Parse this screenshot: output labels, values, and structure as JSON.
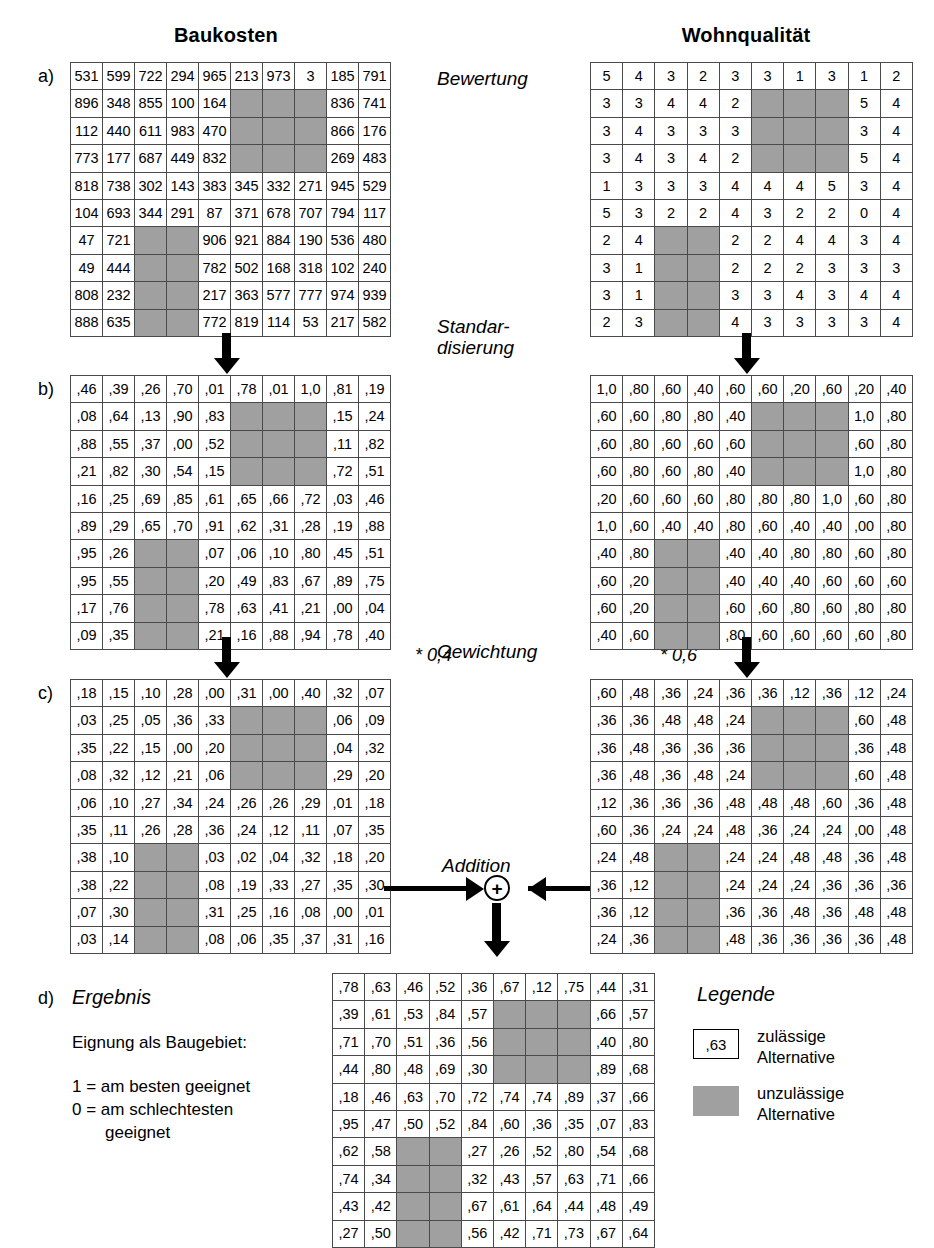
{
  "headers": {
    "left": "Baukosten",
    "right": "Wohnqualität"
  },
  "steps": {
    "bewertung": "Bewertung",
    "standardisierung_l1": "Standar-",
    "standardisierung_l2": "disierung",
    "gewichtung": "Gewichtung",
    "addition": "Addition",
    "weight_left": "* 0,4",
    "weight_right": "* 0,6",
    "plus_symbol": "+"
  },
  "panel_letters": {
    "a": "a)",
    "b": "b)",
    "c": "c)",
    "d": "d)"
  },
  "result": {
    "title": "Ergebnis",
    "caption": "Eignung als Baugebiet:",
    "line1": "1 = am besten geeignet",
    "line2": "0 = am schlechtesten",
    "line3": "geeignet"
  },
  "legend": {
    "title": "Legende",
    "sample_value": ",63",
    "allowed_l1": "zulässige",
    "allowed_l2": "Alternative",
    "disallowed_l1": "unzulässige",
    "disallowed_l2": "Alternative"
  },
  "colors": {
    "gray_cell": "#a0a0a0",
    "grid_border": "#4a4a4a",
    "ink": "#000000"
  },
  "chart_data": {
    "type": "heatmap",
    "grid_size": [
      10,
      10
    ],
    "mask_note": "null = unzulässige Alternative (graue Zelle)",
    "grids": {
      "baukosten_a": {
        "label": "a) Baukosten - Bewertung (Rohwerte)",
        "rows": [
          [
            "531",
            "599",
            "722",
            "294",
            "965",
            "213",
            "973",
            "3",
            "185",
            "791"
          ],
          [
            "896",
            "348",
            "855",
            "100",
            "164",
            null,
            null,
            null,
            "836",
            "741"
          ],
          [
            "112",
            "440",
            "611",
            "983",
            "470",
            null,
            null,
            null,
            "866",
            "176"
          ],
          [
            "773",
            "177",
            "687",
            "449",
            "832",
            null,
            null,
            null,
            "269",
            "483"
          ],
          [
            "818",
            "738",
            "302",
            "143",
            "383",
            "345",
            "332",
            "271",
            "945",
            "529"
          ],
          [
            "104",
            "693",
            "344",
            "291",
            "87",
            "371",
            "678",
            "707",
            "794",
            "117"
          ],
          [
            "47",
            "721",
            null,
            null,
            "906",
            "921",
            "884",
            "190",
            "536",
            "480"
          ],
          [
            "49",
            "444",
            null,
            null,
            "782",
            "502",
            "168",
            "318",
            "102",
            "240"
          ],
          [
            "808",
            "232",
            null,
            null,
            "217",
            "363",
            "577",
            "777",
            "974",
            "939"
          ],
          [
            "888",
            "635",
            null,
            null,
            "772",
            "819",
            "114",
            "53",
            "217",
            "582"
          ]
        ]
      },
      "wohnqualitaet_a": {
        "label": "a) Wohnqualität - Bewertung (Rohwerte 0-5)",
        "rows": [
          [
            "5",
            "4",
            "3",
            "2",
            "3",
            "3",
            "1",
            "3",
            "1",
            "2"
          ],
          [
            "3",
            "3",
            "4",
            "4",
            "2",
            null,
            null,
            null,
            "5",
            "4"
          ],
          [
            "3",
            "4",
            "3",
            "3",
            "3",
            null,
            null,
            null,
            "3",
            "4"
          ],
          [
            "3",
            "4",
            "3",
            "4",
            "2",
            null,
            null,
            null,
            "5",
            "4"
          ],
          [
            "1",
            "3",
            "3",
            "3",
            "4",
            "4",
            "4",
            "5",
            "3",
            "4"
          ],
          [
            "5",
            "3",
            "2",
            "2",
            "4",
            "3",
            "2",
            "2",
            "0",
            "4"
          ],
          [
            "2",
            "4",
            null,
            null,
            "2",
            "2",
            "4",
            "4",
            "3",
            "4"
          ],
          [
            "3",
            "1",
            null,
            null,
            "2",
            "2",
            "2",
            "3",
            "3",
            "3"
          ],
          [
            "3",
            "1",
            null,
            null,
            "3",
            "3",
            "4",
            "3",
            "4",
            "4"
          ],
          [
            "2",
            "3",
            null,
            null,
            "4",
            "3",
            "3",
            "3",
            "3",
            "4"
          ]
        ]
      },
      "baukosten_b": {
        "label": "b) Baukosten - Standardisierung",
        "rows": [
          [
            ",46",
            ",39",
            ",26",
            ",70",
            ",01",
            ",78",
            ",01",
            "1,0",
            ",81",
            ",19"
          ],
          [
            ",08",
            ",64",
            ",13",
            ",90",
            ",83",
            null,
            null,
            null,
            ",15",
            ",24"
          ],
          [
            ",88",
            ",55",
            ",37",
            ",00",
            ",52",
            null,
            null,
            null,
            ",11",
            ",82"
          ],
          [
            ",21",
            ",82",
            ",30",
            ",54",
            ",15",
            null,
            null,
            null,
            ",72",
            ",51"
          ],
          [
            ",16",
            ",25",
            ",69",
            ",85",
            ",61",
            ",65",
            ",66",
            ",72",
            ",03",
            ",46"
          ],
          [
            ",89",
            ",29",
            ",65",
            ",70",
            ",91",
            ",62",
            ",31",
            ",28",
            ",19",
            ",88"
          ],
          [
            ",95",
            ",26",
            null,
            null,
            ",07",
            ",06",
            ",10",
            ",80",
            ",45",
            ",51"
          ],
          [
            ",95",
            ",55",
            null,
            null,
            ",20",
            ",49",
            ",83",
            ",67",
            ",89",
            ",75"
          ],
          [
            ",17",
            ",76",
            null,
            null,
            ",78",
            ",63",
            ",41",
            ",21",
            ",00",
            ",04"
          ],
          [
            ",09",
            ",35",
            null,
            null,
            ",21",
            ",16",
            ",88",
            ",94",
            ",78",
            ",40"
          ]
        ]
      },
      "wohnqualitaet_b": {
        "label": "b) Wohnqualität - Standardisierung",
        "rows": [
          [
            "1,0",
            ",80",
            ",60",
            ",40",
            ",60",
            ",60",
            ",20",
            ",60",
            ",20",
            ",40"
          ],
          [
            ",60",
            ",60",
            ",80",
            ",80",
            ",40",
            null,
            null,
            null,
            "1,0",
            ",80"
          ],
          [
            ",60",
            ",80",
            ",60",
            ",60",
            ",60",
            null,
            null,
            null,
            ",60",
            ",80"
          ],
          [
            ",60",
            ",80",
            ",60",
            ",80",
            ",40",
            null,
            null,
            null,
            "1,0",
            ",80"
          ],
          [
            ",20",
            ",60",
            ",60",
            ",60",
            ",80",
            ",80",
            ",80",
            "1,0",
            ",60",
            ",80"
          ],
          [
            "1,0",
            ",60",
            ",40",
            ",40",
            ",80",
            ",60",
            ",40",
            ",40",
            ",00",
            ",80"
          ],
          [
            ",40",
            ",80",
            null,
            null,
            ",40",
            ",40",
            ",80",
            ",80",
            ",60",
            ",80"
          ],
          [
            ",60",
            ",20",
            null,
            null,
            ",40",
            ",40",
            ",40",
            ",60",
            ",60",
            ",60"
          ],
          [
            ",60",
            ",20",
            null,
            null,
            ",60",
            ",60",
            ",80",
            ",60",
            ",80",
            ",80"
          ],
          [
            ",40",
            ",60",
            null,
            null,
            ",80",
            ",60",
            ",60",
            ",60",
            ",60",
            ",80"
          ]
        ]
      },
      "baukosten_c": {
        "label": "c) Baukosten - Gewichtung (* 0,4)",
        "rows": [
          [
            ",18",
            ",15",
            ",10",
            ",28",
            ",00",
            ",31",
            ",00",
            ",40",
            ",32",
            ",07"
          ],
          [
            ",03",
            ",25",
            ",05",
            ",36",
            ",33",
            null,
            null,
            null,
            ",06",
            ",09"
          ],
          [
            ",35",
            ",22",
            ",15",
            ",00",
            ",20",
            null,
            null,
            null,
            ",04",
            ",32"
          ],
          [
            ",08",
            ",32",
            ",12",
            ",21",
            ",06",
            null,
            null,
            null,
            ",29",
            ",20"
          ],
          [
            ",06",
            ",10",
            ",27",
            ",34",
            ",24",
            ",26",
            ",26",
            ",29",
            ",01",
            ",18"
          ],
          [
            ",35",
            ",11",
            ",26",
            ",28",
            ",36",
            ",24",
            ",12",
            ",11",
            ",07",
            ",35"
          ],
          [
            ",38",
            ",10",
            null,
            null,
            ",03",
            ",02",
            ",04",
            ",32",
            ",18",
            ",20"
          ],
          [
            ",38",
            ",22",
            null,
            null,
            ",08",
            ",19",
            ",33",
            ",27",
            ",35",
            ",30"
          ],
          [
            ",07",
            ",30",
            null,
            null,
            ",31",
            ",25",
            ",16",
            ",08",
            ",00",
            ",01"
          ],
          [
            ",03",
            ",14",
            null,
            null,
            ",08",
            ",06",
            ",35",
            ",37",
            ",31",
            ",16"
          ]
        ]
      },
      "wohnqualitaet_c": {
        "label": "c) Wohnqualität - Gewichtung (* 0,6)",
        "rows": [
          [
            ",60",
            ",48",
            ",36",
            ",24",
            ",36",
            ",36",
            ",12",
            ",36",
            ",12",
            ",24"
          ],
          [
            ",36",
            ",36",
            ",48",
            ",48",
            ",24",
            null,
            null,
            null,
            ",60",
            ",48"
          ],
          [
            ",36",
            ",48",
            ",36",
            ",36",
            ",36",
            null,
            null,
            null,
            ",36",
            ",48"
          ],
          [
            ",36",
            ",48",
            ",36",
            ",48",
            ",24",
            null,
            null,
            null,
            ",60",
            ",48"
          ],
          [
            ",12",
            ",36",
            ",36",
            ",36",
            ",48",
            ",48",
            ",48",
            ",60",
            ",36",
            ",48"
          ],
          [
            ",60",
            ",36",
            ",24",
            ",24",
            ",48",
            ",36",
            ",24",
            ",24",
            ",00",
            ",48"
          ],
          [
            ",24",
            ",48",
            null,
            null,
            ",24",
            ",24",
            ",48",
            ",48",
            ",36",
            ",48"
          ],
          [
            ",36",
            ",12",
            null,
            null,
            ",24",
            ",24",
            ",24",
            ",36",
            ",36",
            ",36"
          ],
          [
            ",36",
            ",12",
            null,
            null,
            ",36",
            ",36",
            ",48",
            ",36",
            ",48",
            ",48"
          ],
          [
            ",24",
            ",36",
            null,
            null,
            ",48",
            ",36",
            ",36",
            ",36",
            ",36",
            ",48"
          ]
        ]
      },
      "ergebnis_d": {
        "label": "d) Ergebnis - Addition",
        "rows": [
          [
            ",78",
            ",63",
            ",46",
            ",52",
            ",36",
            ",67",
            ",12",
            ",75",
            ",44",
            ",31"
          ],
          [
            ",39",
            ",61",
            ",53",
            ",84",
            ",57",
            null,
            null,
            null,
            ",66",
            ",57"
          ],
          [
            ",71",
            ",70",
            ",51",
            ",36",
            ",56",
            null,
            null,
            null,
            ",40",
            ",80"
          ],
          [
            ",44",
            ",80",
            ",48",
            ",69",
            ",30",
            null,
            null,
            null,
            ",89",
            ",68"
          ],
          [
            ",18",
            ",46",
            ",63",
            ",70",
            ",72",
            ",74",
            ",74",
            ",89",
            ",37",
            ",66"
          ],
          [
            ",95",
            ",47",
            ",50",
            ",52",
            ",84",
            ",60",
            ",36",
            ",35",
            ",07",
            ",83"
          ],
          [
            ",62",
            ",58",
            null,
            null,
            ",27",
            ",26",
            ",52",
            ",80",
            ",54",
            ",68"
          ],
          [
            ",74",
            ",34",
            null,
            null,
            ",32",
            ",43",
            ",57",
            ",63",
            ",71",
            ",66"
          ],
          [
            ",43",
            ",42",
            null,
            null,
            ",67",
            ",61",
            ",64",
            ",44",
            ",48",
            ",49"
          ],
          [
            ",27",
            ",50",
            null,
            null,
            ",56",
            ",42",
            ",71",
            ",73",
            ",67",
            ",64"
          ]
        ]
      }
    }
  }
}
